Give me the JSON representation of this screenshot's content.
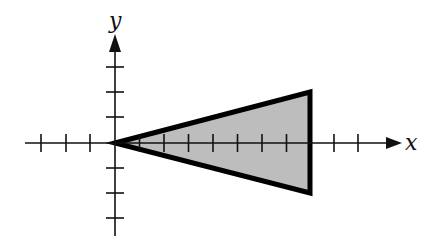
{
  "diagram": {
    "type": "coordinate-plane",
    "x_axis_label": "x",
    "y_axis_label": "y",
    "origin_px": [
      115,
      143
    ],
    "unit_px": 24.5,
    "x_ticks": [
      -3,
      -2,
      -1,
      1,
      2,
      3,
      4,
      5,
      6,
      7,
      8,
      9,
      10
    ],
    "y_ticks": [
      -3,
      -2,
      -1,
      1,
      2,
      3
    ],
    "shape": {
      "name": "triangle",
      "vertices": [
        [
          0,
          0
        ],
        [
          8,
          2
        ],
        [
          8,
          -2
        ]
      ],
      "fill": "#bdbdbd",
      "stroke": "#000000"
    }
  }
}
